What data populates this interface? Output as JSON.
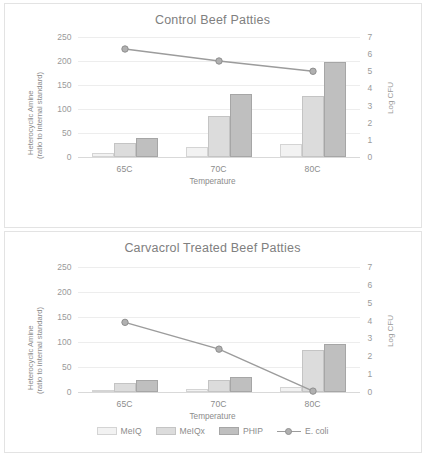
{
  "figure": {
    "background": "#ffffff",
    "panels": 2
  },
  "colors": {
    "meiq": "#f2f2f2",
    "meiq_border": "#d4d4d4",
    "meiqx": "#dcdcdc",
    "meiqx_border": "#c4c4c4",
    "phip": "#bfbfbf",
    "phip_border": "#a6a6a6",
    "ecoli_line": "#9c9c9c",
    "ecoli_marker": "#b0b0b0",
    "grid": "#ededed",
    "text": "#8c8c8c",
    "tick_text": "#9a9a9a",
    "title_text": "#808080",
    "card_border": "#e3e3e3"
  },
  "legend": {
    "items": [
      {
        "label": "MeIQ",
        "type": "bar",
        "color": "#f2f2f2"
      },
      {
        "label": "MeIQx",
        "type": "bar",
        "color": "#dcdcdc"
      },
      {
        "label": "PHIP",
        "type": "bar",
        "color": "#bfbfbf"
      },
      {
        "label": "E. coli",
        "type": "line",
        "color": "#9c9c9c"
      }
    ]
  },
  "chart_data": [
    {
      "id": "control",
      "type": "bar",
      "title": "Control Beef Patties",
      "xlabel": "Temperature",
      "ylabel": "Heterocyclic Amine\n(ratio to internal standard)",
      "ylabel_line1": "Heterocyclic Amine",
      "ylabel_line2": "(ratio to internal standard)",
      "y2label": "Log CFU",
      "categories": [
        "65C",
        "70C",
        "80C"
      ],
      "ylim": [
        0,
        250
      ],
      "yticks": [
        0,
        50,
        100,
        150,
        200,
        250
      ],
      "y2lim": [
        0,
        7
      ],
      "y2ticks": [
        0,
        1,
        2,
        3,
        4,
        5,
        6,
        7
      ],
      "grid": true,
      "legend_position": "none",
      "series": [
        {
          "name": "MeIQ",
          "axis": "left",
          "type": "bar",
          "values": [
            9,
            20,
            27
          ]
        },
        {
          "name": "MeIQx",
          "axis": "left",
          "type": "bar",
          "values": [
            29,
            85,
            127
          ]
        },
        {
          "name": "PHIP",
          "axis": "left",
          "type": "bar",
          "values": [
            39,
            132,
            198
          ]
        },
        {
          "name": "E. coli",
          "axis": "right",
          "type": "line",
          "values": [
            6.3,
            5.6,
            5.0
          ]
        }
      ]
    },
    {
      "id": "carvacrol",
      "type": "bar",
      "title": "Carvacrol Treated Beef Patties",
      "xlabel": "Temperature",
      "ylabel": "Heterocyclic Amine\n(ratio to internal standard)",
      "ylabel_line1": "Heterocyclic Amine",
      "ylabel_line2": "(ratio to internal standard)",
      "y2label": "Log CFU",
      "categories": [
        "65C",
        "70C",
        "80C"
      ],
      "ylim": [
        0,
        250
      ],
      "yticks": [
        0,
        50,
        100,
        150,
        200,
        250
      ],
      "y2lim": [
        0,
        7
      ],
      "y2ticks": [
        0,
        1,
        2,
        3,
        4,
        5,
        6,
        7
      ],
      "grid": true,
      "legend_position": "bottom",
      "series": [
        {
          "name": "MeIQ",
          "axis": "left",
          "type": "bar",
          "values": [
            5,
            7,
            10
          ]
        },
        {
          "name": "MeIQx",
          "axis": "left",
          "type": "bar",
          "values": [
            18,
            25,
            84
          ]
        },
        {
          "name": "PHIP",
          "axis": "left",
          "type": "bar",
          "values": [
            25,
            30,
            96
          ]
        },
        {
          "name": "E. coli",
          "axis": "right",
          "type": "line",
          "values": [
            3.9,
            2.4,
            0.05
          ]
        }
      ]
    }
  ]
}
